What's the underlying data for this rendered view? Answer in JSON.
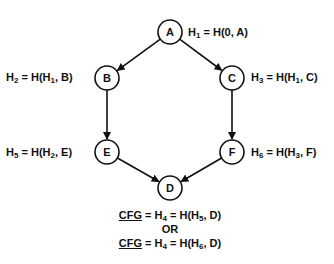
{
  "nodes": [
    {
      "id": "A",
      "label": "A"
    },
    {
      "id": "B",
      "label": "B"
    },
    {
      "id": "C",
      "label": "C"
    },
    {
      "id": "E",
      "label": "E"
    },
    {
      "id": "F",
      "label": "F"
    },
    {
      "id": "D",
      "label": "D"
    }
  ],
  "edges": [
    {
      "from": "A",
      "to": "B"
    },
    {
      "from": "A",
      "to": "C"
    },
    {
      "from": "B",
      "to": "E"
    },
    {
      "from": "C",
      "to": "F"
    },
    {
      "from": "E",
      "to": "D"
    },
    {
      "from": "F",
      "to": "D"
    }
  ],
  "labels": {
    "A": {
      "h": "H",
      "hsub": "1",
      "eq": " = H(0, A)"
    },
    "B": {
      "h": "H",
      "hsub": "2",
      "eq1": " = H(H",
      "eqsub": "1",
      "eq2": ", B)"
    },
    "C": {
      "h": "H",
      "hsub": "3",
      "eq1": " = H(H",
      "eqsub": "1",
      "eq2": ", C)"
    },
    "E": {
      "h": "H",
      "hsub": "5",
      "eq1": " = H(H",
      "eqsub": "2",
      "eq2": ", E)"
    },
    "F": {
      "h": "H",
      "hsub": "6",
      "eq1": " = H(H",
      "eqsub": "3",
      "eq2": ", F)"
    }
  },
  "formula": {
    "line1": {
      "cfg": "CFG",
      "mid": " = H",
      "midsub": "4",
      "eq1": " = H(H",
      "eqsub": "5",
      "eq2": ", D)"
    },
    "or": "OR",
    "line2": {
      "cfg": "CFG",
      "mid": " = H",
      "midsub": "4",
      "eq1": " = H(H",
      "eqsub": "6",
      "eq2": ", D)"
    }
  }
}
